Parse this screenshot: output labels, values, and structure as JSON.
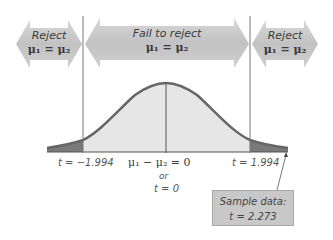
{
  "arrows": {
    "left": {
      "line1": "Reject",
      "line2": "μ₁ = μ₂"
    },
    "center": {
      "line1": "Fail to reject",
      "line2": "μ₁ = μ₂"
    },
    "right": {
      "line1": "Reject",
      "line2": "μ₁ = μ₂"
    }
  },
  "axis_labels": {
    "left_critical": "t = −1.994",
    "center": "μ₁ − μ₂ = 0",
    "center_or": "or",
    "center_t": "t = 0",
    "right_critical": "t = 1.994"
  },
  "sample_box": {
    "line1": "Sample data:",
    "line2": "t = 2.273"
  },
  "colors": {
    "curve": "#666666",
    "body_fill": "#e6e6e6",
    "tail_fill": "#7a7a7a",
    "arrow_fill": "#c4c4c4",
    "box_fill": "#c8c8c8"
  }
}
